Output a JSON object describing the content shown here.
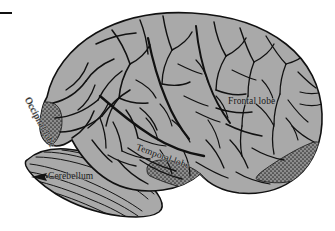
{
  "figure": {
    "type": "anatomical-illustration",
    "background_color": "#ffffff",
    "brain_fill_color": "#a9a9a9",
    "outline_color": "#111111",
    "shaded_region_color": "#6e6e6e",
    "label_color": "#1a1a1a",
    "corner_mark": "—"
  },
  "labels": {
    "frontal_lobe": "Frontal lobe",
    "occipital_lobe": "Occipital lobe",
    "temporal_lobe": "Temporal lobe",
    "cerebellum": "Cerebellum"
  }
}
